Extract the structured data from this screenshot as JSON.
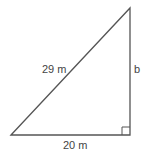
{
  "diagram": {
    "type": "right-triangle",
    "hypotenuse_label": "29 m",
    "base_label": "20 m",
    "vertical_side_label": "b",
    "right_angle_marker": true,
    "stroke_color": "#555555"
  }
}
